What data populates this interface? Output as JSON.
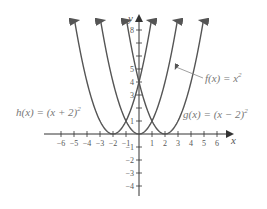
{
  "chart_data": {
    "type": "line",
    "title": "",
    "xlabel": "x",
    "ylabel": "y",
    "xlim": [
      -6.5,
      7
    ],
    "ylim": [
      -4.5,
      8.5
    ],
    "x_ticks": [
      -6,
      -5,
      -4,
      -3,
      -2,
      -1,
      1,
      2,
      3,
      4,
      5,
      6
    ],
    "y_ticks": [
      -4,
      -3,
      -2,
      -1,
      1,
      2,
      3,
      4,
      5,
      6,
      7,
      8
    ],
    "y_tick_labels_shown": [
      "-4",
      "-3",
      "-2",
      "-1",
      "1",
      "3",
      "4",
      "5",
      "8"
    ],
    "series": [
      {
        "name": "f(x) = x^2",
        "expression": "x^2",
        "vertex": [
          0,
          0
        ]
      },
      {
        "name": "g(x) = (x - 2)^2",
        "expression": "(x-2)^2",
        "vertex": [
          2,
          0
        ]
      },
      {
        "name": "h(x) = (x + 2)^2",
        "expression": "(x+2)^2",
        "vertex": [
          -2,
          0
        ]
      }
    ],
    "annotations": [
      {
        "text": "f(x) = x²",
        "arrow_to": "f curve right branch"
      },
      {
        "text": "g(x) = (x − 2)²"
      },
      {
        "text": "h(x) = (x + 2)²"
      }
    ],
    "grid": false
  },
  "labels": {
    "x_axis": "x",
    "y_axis": "y",
    "f": "f(x) = x",
    "g": "g(x) = (x − 2)",
    "h": "h(x) = (x + 2)",
    "sq": "2"
  },
  "colors": {
    "curve": "#555555",
    "axis": "#333333",
    "label": "#777777"
  }
}
